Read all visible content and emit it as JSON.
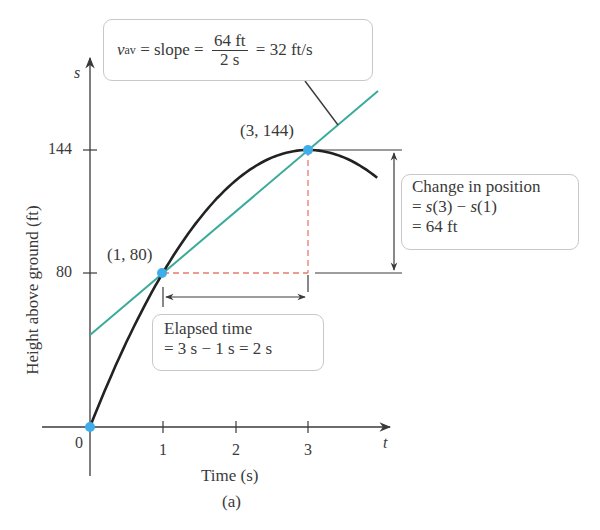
{
  "chart_data": {
    "type": "line",
    "title": "",
    "subtitle": "(a)",
    "xlabel": "Time (s)",
    "ylabel": "Height above ground (ft)",
    "x_axis_variable": "t",
    "y_axis_variable": "s",
    "x_ticks": [
      "0",
      "1",
      "2",
      "3"
    ],
    "y_ticks": [
      "80",
      "144"
    ],
    "xlim": [
      0,
      4.2
    ],
    "ylim": [
      0,
      165
    ],
    "grid": false,
    "series": [
      {
        "name": "s(t) position curve",
        "color": "#222222",
        "x": [
          0,
          0.5,
          1,
          1.5,
          2,
          2.5,
          3,
          3.5,
          3.97
        ],
        "values": [
          0,
          44,
          80,
          108,
          128,
          140,
          144,
          140,
          129
        ]
      },
      {
        "name": "secant line",
        "color": "#3aaa9a",
        "x": [
          0,
          4.0
        ],
        "values": [
          48,
          176
        ]
      }
    ],
    "points": [
      {
        "label": "(0, 0)",
        "x": 0,
        "y": 0,
        "show_label": false
      },
      {
        "label": "(1, 80)",
        "x": 1,
        "y": 80,
        "show_label": true
      },
      {
        "label": "(3, 144)",
        "x": 3,
        "y": 144,
        "show_label": true
      }
    ],
    "annotations": [
      {
        "id": "slope",
        "text": "v_av = slope = 64 ft / 2 s = 32 ft/s"
      },
      {
        "id": "position",
        "text": "Change in position = s(3) − s(1) = 64 ft"
      },
      {
        "id": "elapsed",
        "text": "Elapsed time = 3 s − 1 s = 2 s"
      }
    ]
  },
  "labels": {
    "y_var": "s",
    "x_var": "t",
    "tick_0": "0",
    "tick_1": "1",
    "tick_2": "2",
    "tick_3": "3",
    "tick_80": "80",
    "tick_144": "144",
    "xlabel": "Time (s)",
    "ylabel": "Height above ground (ft)",
    "caption": "(a)",
    "pt1": "(1, 80)",
    "pt3": "(3, 144)"
  },
  "slope_box": {
    "v": "v",
    "sub": "av",
    "eq1": " = slope = ",
    "num": "64 ft",
    "den": "2 s",
    "eq2": " = 32 ft/s"
  },
  "position_box": {
    "line1": "Change in position",
    "eq_a": "= ",
    "s3": "s",
    "p3": "(3) − ",
    "s1": "s",
    "p1": "(1)",
    "line3": "= 64 ft"
  },
  "elapsed_box": {
    "line1": "Elapsed time",
    "line2": "= 3 s − 1 s = 2 s"
  },
  "colors": {
    "curve": "#222222",
    "secant": "#3aaa9a",
    "point": "#3daee9",
    "dashed": "#e87a6e",
    "axis": "#3a3a3a"
  }
}
